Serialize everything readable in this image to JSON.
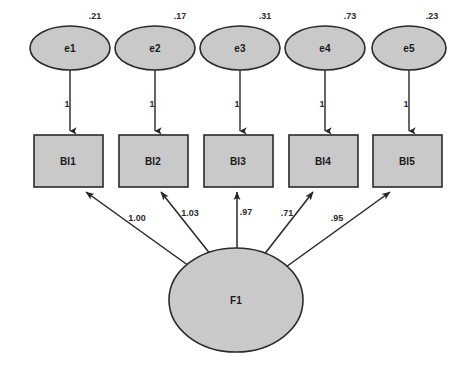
{
  "diagram": {
    "type": "sem-path-diagram",
    "title": "",
    "background_color": "#ffffff",
    "node_fill_color": "#c9c9c9",
    "node_stroke_color": "#2a2a2a",
    "edge_color": "#262626"
  },
  "errors": [
    {
      "id": "e1",
      "label": "e1",
      "variance": ".21",
      "cx": 70,
      "cy": 48,
      "rx": 40,
      "ry": 22,
      "var_x": 95,
      "var_y": 17
    },
    {
      "id": "e2",
      "label": "e2",
      "variance": ".17",
      "cx": 155,
      "cy": 48,
      "rx": 40,
      "ry": 22,
      "var_x": 180,
      "var_y": 17
    },
    {
      "id": "e3",
      "label": "e3",
      "variance": ".31",
      "cx": 240,
      "cy": 48,
      "rx": 40,
      "ry": 22,
      "var_x": 265,
      "var_y": 17
    },
    {
      "id": "e4",
      "label": "e4",
      "variance": ".73",
      "cx": 325,
      "cy": 48,
      "rx": 40,
      "ry": 22,
      "var_x": 350,
      "var_y": 17
    },
    {
      "id": "e5",
      "label": "e5",
      "variance": ".23",
      "cx": 409,
      "cy": 48,
      "rx": 37,
      "ry": 22,
      "var_x": 432,
      "var_y": 17
    }
  ],
  "indicators": [
    {
      "id": "BI1",
      "label": "BI1",
      "x": 34,
      "y": 135,
      "w": 69,
      "h": 52,
      "error_path_label": "1",
      "loading": "1.00",
      "loading_x": 137,
      "loading_y": 219
    },
    {
      "id": "BI2",
      "label": "BI2",
      "x": 119,
      "y": 135,
      "w": 69,
      "h": 52,
      "error_path_label": "1",
      "loading": "1.03",
      "loading_x": 189,
      "loading_y": 214
    },
    {
      "id": "BI3",
      "label": "BI3",
      "x": 204,
      "y": 135,
      "w": 69,
      "h": 52,
      "error_path_label": "1",
      "loading": ".97",
      "loading_x": 243,
      "loading_y": 213
    },
    {
      "id": "BI4",
      "label": "BI4",
      "x": 289,
      "y": 135,
      "w": 69,
      "h": 52,
      "error_path_label": "1",
      "loading": ".71",
      "loading_x": 288,
      "loading_y": 214
    },
    {
      "id": "BI5",
      "label": "BI5",
      "x": 373,
      "y": 135,
      "w": 69,
      "h": 52,
      "error_path_label": "1",
      "loading": ".95",
      "loading_x": 337,
      "loading_y": 219
    }
  ],
  "factor": {
    "id": "F1",
    "label": "F1",
    "cx": 236,
    "cy": 300,
    "rx": 67,
    "ry": 52
  },
  "error_path_labels": [
    {
      "text": "1",
      "x": 67,
      "y": 105
    },
    {
      "text": "1",
      "x": 152,
      "y": 105
    },
    {
      "text": "1",
      "x": 237,
      "y": 105
    },
    {
      "text": "1",
      "x": 322,
      "y": 105
    },
    {
      "text": "1",
      "x": 406,
      "y": 105
    }
  ]
}
